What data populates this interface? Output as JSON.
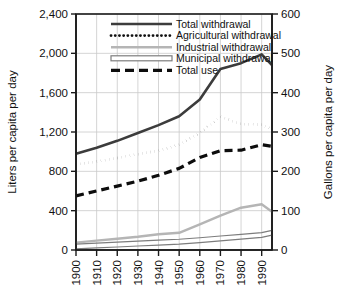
{
  "chart_data": {
    "type": "line",
    "title": "",
    "subtitle": "",
    "xlabel": "",
    "ylabel": "Liters per capita per day",
    "y2label": "Gallons per capita per day",
    "grid": true,
    "legend_position": "top-center",
    "x": [
      1900,
      1910,
      1920,
      1930,
      1940,
      1950,
      1960,
      1970,
      1980,
      1990,
      1995
    ],
    "xtick_labels": [
      "1900",
      "1910",
      "1920",
      "1930",
      "1940",
      "1950",
      "1960",
      "1970",
      "1980",
      "1990"
    ],
    "xlim": [
      1900,
      1995
    ],
    "ylim": [
      0,
      2400
    ],
    "ytick_labels": [
      "0",
      "400",
      "800",
      "1,200",
      "1,600",
      "2,000",
      "2,400"
    ],
    "ytick_values": [
      0,
      400,
      800,
      1200,
      1600,
      2000,
      2400
    ],
    "y2lim": [
      0,
      600
    ],
    "y2tick_labels": [
      "0",
      "100",
      "200",
      "300",
      "400",
      "500",
      "600"
    ],
    "y2tick_values": [
      0,
      100,
      200,
      300,
      400,
      500,
      600
    ],
    "series": [
      {
        "name": "Total withdrawal",
        "style": "solid",
        "color": "#3c3c3c",
        "width": 2.6,
        "values": [
          980,
          1040,
          1110,
          1190,
          1270,
          1360,
          1530,
          1840,
          1900,
          1990,
          1880
        ]
      },
      {
        "name": "Agricultural withdrawal",
        "style": "dotted",
        "color": "#111111",
        "width": 2.8,
        "values": [
          870,
          900,
          935,
          975,
          1010,
          1070,
          1190,
          1355,
          1280,
          1275,
          1230
        ]
      },
      {
        "name": "Industrial withdrawal",
        "style": "solid",
        "color": "#b5b5b5",
        "width": 2.4,
        "values": [
          75,
          95,
          115,
          135,
          160,
          175,
          260,
          350,
          430,
          465,
          390
        ]
      },
      {
        "name": "Municipal withdrawal",
        "style": "outlined",
        "color": "#7d7d7d",
        "width": 2.0,
        "values": [
          35,
          45,
          55,
          65,
          75,
          85,
          100,
          118,
          135,
          152,
          175
        ]
      },
      {
        "name": "Total use",
        "style": "dashed",
        "color": "#0d0d0d",
        "width": 3.2,
        "values": [
          550,
          600,
          650,
          700,
          760,
          830,
          940,
          1010,
          1015,
          1070,
          1055
        ]
      }
    ]
  },
  "legend": {
    "entries": [
      {
        "label": "Total withdrawal",
        "swatch": "solid-dark"
      },
      {
        "label": "Agricultural withdrawal",
        "swatch": "dotted-black"
      },
      {
        "label": "Industrial withdrawal",
        "swatch": "solid-lightgray"
      },
      {
        "label": "Municipal withdrawal",
        "swatch": "outlined-bar"
      },
      {
        "label": "Total use",
        "swatch": "dashed-black"
      }
    ]
  },
  "colors": {
    "background": "#ffffff",
    "grid": "#c9c9c9",
    "axis": "#1a1a1a",
    "total_withdrawal": "#3c3c3c",
    "agricultural_withdrawal": "#111111",
    "industrial_withdrawal": "#b5b5b5",
    "municipal_withdrawal": "#7d7d7d",
    "total_use": "#0d0d0d"
  }
}
